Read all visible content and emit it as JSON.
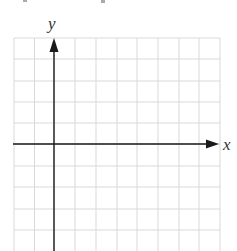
{
  "diagram": {
    "type": "coordinate-grid",
    "x_axis_label": "x",
    "y_axis_label": "y",
    "grid": {
      "columns": 10,
      "rows_visible": 10,
      "origin_col": 2,
      "origin_row": 5,
      "cell_size_px": 20.6
    },
    "colors": {
      "grid": "#d9d9d9",
      "axis": "#1a1a1a",
      "label": "#333333",
      "background": "#ffffff"
    }
  },
  "chart_data": {
    "type": "scatter",
    "title": "",
    "xlabel": "x",
    "ylabel": "y",
    "series": [],
    "grid": true,
    "xlim": [
      -2,
      8
    ],
    "ylim": [
      -5,
      5
    ]
  }
}
